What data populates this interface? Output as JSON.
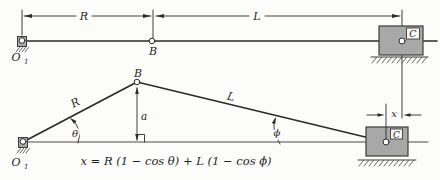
{
  "figure": {
    "colors": {
      "paper": "#fcfcfa",
      "block_fill": "#a8a8a8",
      "block_stroke": "#3c3c3c",
      "line": "#2b2b2b"
    },
    "top": {
      "dim_R": "R",
      "dim_L": "L",
      "point_B": "B",
      "pivot_O1_main": "O",
      "pivot_O1_sub": "1",
      "slider_C": "C"
    },
    "bottom": {
      "link_R": "R",
      "link_L": "L",
      "point_B": "B",
      "pivot_O1_main": "O",
      "pivot_O1_sub": "1",
      "slider_C": "C",
      "dim_a": "a",
      "dim_x": "x",
      "angle_theta": "θ",
      "angle_phi": "ϕ"
    },
    "equation": "x = R (1 − cos θ) + L (1 − cos ϕ)"
  }
}
